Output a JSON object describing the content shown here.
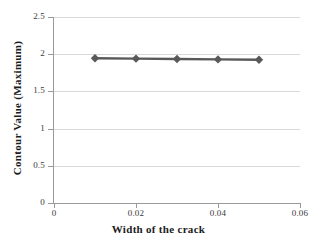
{
  "chart_data": {
    "type": "line",
    "title": "",
    "subtitle": "",
    "xlabel": "Width of the crack",
    "ylabel": "Contour Value (Maximum)",
    "x": [
      0.01,
      0.02,
      0.03,
      0.04,
      0.05
    ],
    "series": [
      {
        "name": "Contour Value (Maximum)",
        "values": [
          1.945,
          1.94,
          1.935,
          1.93,
          1.925
        ],
        "color": "#595959",
        "marker": "diamond"
      }
    ],
    "xlim": [
      0,
      0.06
    ],
    "ylim": [
      0,
      2.5
    ],
    "xticks": [
      0,
      0.02,
      0.04,
      0.06
    ],
    "xtick_labels": [
      "0",
      "0.02",
      "0.04",
      "0.06"
    ],
    "yticks": [
      0,
      0.5,
      1,
      1.5,
      2,
      2.5
    ],
    "ytick_labels": [
      "0",
      "0.5",
      "1",
      "1.5",
      "2",
      "2.5"
    ],
    "grid": {
      "horizontal": true,
      "vertical": false,
      "color": "#d9d9d9"
    },
    "legend": {
      "visible": false,
      "position": "none",
      "entries": []
    },
    "axis_color": "#9a9a9a",
    "background": "#ffffff"
  }
}
